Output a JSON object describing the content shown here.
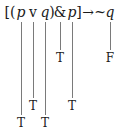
{
  "formula": {
    "symbols": [
      {
        "text": "[(",
        "x": 10
      },
      {
        "text": "p",
        "x": 21,
        "italic": true
      },
      {
        "text": "v",
        "x": 33
      },
      {
        "text": "q",
        "x": 45,
        "italic": true
      },
      {
        "text": ")",
        "x": 52
      },
      {
        "text": "&",
        "x": 60
      },
      {
        "text": "p",
        "x": 72,
        "italic": true
      },
      {
        "text": "]",
        "x": 79
      },
      {
        "text": "→",
        "x": 88
      },
      {
        "text": "~",
        "x": 100
      },
      {
        "text": "q",
        "x": 110,
        "italic": true
      }
    ]
  },
  "truth_values": [
    {
      "column": "p1",
      "value": "T",
      "x": 21,
      "y": 116
    },
    {
      "column": "or",
      "value": "T",
      "x": 33,
      "y": 99
    },
    {
      "column": "q1",
      "value": "T",
      "x": 45,
      "y": 116
    },
    {
      "column": "and",
      "value": "T",
      "x": 60,
      "y": 51
    },
    {
      "column": "p2",
      "value": "T",
      "x": 72,
      "y": 99
    },
    {
      "column": "q2",
      "value": "F",
      "x": 110,
      "y": 51
    }
  ],
  "lines": [
    {
      "x": 21,
      "y1": 22,
      "y2": 115
    },
    {
      "x": 33,
      "y1": 22,
      "y2": 98
    },
    {
      "x": 45,
      "y1": 22,
      "y2": 115
    },
    {
      "x": 60,
      "y1": 22,
      "y2": 50
    },
    {
      "x": 72,
      "y1": 22,
      "y2": 98
    },
    {
      "x": 110,
      "y1": 22,
      "y2": 50
    }
  ]
}
